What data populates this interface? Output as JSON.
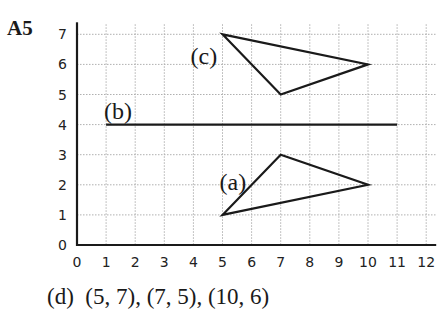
{
  "question_label": "A5",
  "caption": "(d)  (5, 7), (7, 5), (10, 6)",
  "colors": {
    "ink": "#1a1a1a",
    "grid": "#b0b0b0",
    "background": "#ffffff"
  },
  "axes": {
    "x_ticks": [
      "0",
      "1",
      "2",
      "3",
      "4",
      "5",
      "6",
      "7",
      "8",
      "9",
      "10",
      "11",
      "12"
    ],
    "y_ticks": [
      "0",
      "1",
      "2",
      "3",
      "4",
      "5",
      "6",
      "7"
    ],
    "xlim": [
      0,
      12
    ],
    "ylim": [
      0,
      7
    ],
    "grid": true
  },
  "shapes": {
    "a": {
      "label": "(a)",
      "type": "triangle",
      "vertices": [
        [
          5,
          1
        ],
        [
          7,
          3
        ],
        [
          10,
          2
        ]
      ]
    },
    "b": {
      "label": "(b)",
      "type": "line",
      "from": [
        1,
        4
      ],
      "to": [
        11,
        4
      ]
    },
    "c": {
      "label": "(c)",
      "type": "triangle",
      "vertices": [
        [
          5,
          7
        ],
        [
          7,
          5
        ],
        [
          10,
          6
        ]
      ]
    }
  },
  "chart_data": {
    "type": "scatter",
    "title": "A5",
    "xlabel": "",
    "ylabel": "",
    "xlim": [
      0,
      12
    ],
    "ylim": [
      0,
      7
    ],
    "grid": true,
    "x_tick_labels": [
      "0",
      "1",
      "2",
      "3",
      "4",
      "5",
      "6",
      "7",
      "8",
      "9",
      "10",
      "11",
      "12"
    ],
    "y_tick_labels": [
      "0",
      "1",
      "2",
      "3",
      "4",
      "5",
      "6",
      "7"
    ],
    "series": [
      {
        "name": "(a)",
        "shape": "triangle",
        "points": [
          [
            5,
            1
          ],
          [
            7,
            3
          ],
          [
            10,
            2
          ]
        ]
      },
      {
        "name": "(b)",
        "shape": "line segment",
        "points": [
          [
            1,
            4
          ],
          [
            11,
            4
          ]
        ]
      },
      {
        "name": "(c)",
        "shape": "triangle",
        "points": [
          [
            5,
            7
          ],
          [
            7,
            5
          ],
          [
            10,
            6
          ]
        ]
      }
    ],
    "annotations": [
      "(d)  (5, 7), (7, 5), (10, 6)"
    ]
  }
}
